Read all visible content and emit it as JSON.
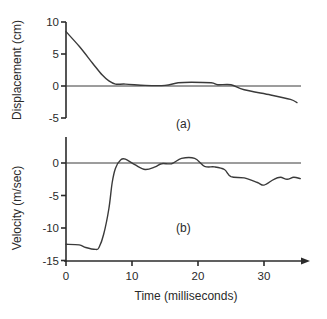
{
  "figure": {
    "panel_a_label": "(a)",
    "panel_b_label": "(b)",
    "x_axis_title": "Time (milliseconds)"
  },
  "chart_data": [
    {
      "type": "line",
      "panel": "(a)",
      "title": "",
      "xlabel": "",
      "ylabel": "Displacement (cm)",
      "xlim": [
        0,
        35.5
      ],
      "ylim": [
        -5,
        10
      ],
      "yticks": [
        10,
        5,
        0,
        -5
      ],
      "ytick_labels": [
        "10",
        "5",
        "0",
        "-5"
      ],
      "grid": false,
      "reference_line": 0,
      "series": [
        {
          "name": "Displacement",
          "x": [
            0,
            2,
            4,
            5.5,
            6.5,
            7.5,
            9,
            12,
            15,
            17,
            19,
            22,
            23,
            25,
            27,
            31,
            34,
            35
          ],
          "y": [
            8.5,
            6.2,
            3.6,
            1.7,
            0.8,
            0.3,
            0.3,
            0.1,
            0.1,
            0.5,
            0.6,
            0.5,
            0.2,
            0.2,
            -0.6,
            -1.4,
            -2.1,
            -2.6
          ]
        }
      ]
    },
    {
      "type": "line",
      "panel": "(b)",
      "title": "",
      "xlabel": "Time (milliseconds)",
      "ylabel": "Velocity (m/sec)",
      "xlim": [
        0,
        36
      ],
      "ylim": [
        -15,
        1.5
      ],
      "xticks": [
        0,
        10,
        20,
        30
      ],
      "xtick_labels": [
        "0",
        "10",
        "20",
        "30"
      ],
      "yticks": [
        0,
        -5,
        -10,
        -15
      ],
      "ytick_labels": [
        "0",
        "-5",
        "-10",
        "-15"
      ],
      "grid": false,
      "reference_line": 0,
      "series": [
        {
          "name": "Velocity",
          "x": [
            0,
            2,
            3,
            4.5,
            5,
            5.7,
            6.5,
            7,
            7.5,
            8.3,
            9,
            10.5,
            12,
            13.5,
            14.5,
            16,
            17.5,
            19.5,
            21,
            22.5,
            24,
            25,
            27,
            29,
            30,
            31.5,
            32.5,
            33.5,
            34.5,
            35.5
          ],
          "y": [
            -12.5,
            -12.6,
            -13.0,
            -13.3,
            -13.0,
            -11,
            -7,
            -3,
            -0.8,
            0.5,
            0.6,
            -0.3,
            -1.0,
            -0.6,
            -0.1,
            -0.1,
            0.7,
            0.7,
            -0.5,
            -0.6,
            -1.0,
            -2.1,
            -2.3,
            -3.0,
            -3.4,
            -2.5,
            -2.2,
            -2.5,
            -2.2,
            -2.4
          ]
        }
      ]
    }
  ]
}
